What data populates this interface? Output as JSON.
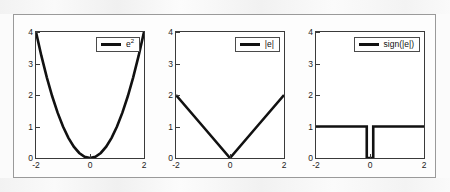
{
  "figure": {
    "background_color": "#fbfbfb",
    "frame_color": "#9a9a9a",
    "line_color": "#111111",
    "axis_color": "#3a3a3a"
  },
  "chart_data": [
    {
      "type": "line",
      "title": "",
      "xlabel": "",
      "ylabel": "",
      "xlim": [
        -2,
        2
      ],
      "ylim": [
        0,
        4
      ],
      "xticks": [
        -2,
        0,
        2
      ],
      "xticklabels": [
        "-2",
        "0",
        "2"
      ],
      "yticks": [
        0,
        1,
        2,
        3,
        4
      ],
      "yticklabels": [
        "0",
        "1",
        "2",
        "3",
        "4"
      ],
      "grid": false,
      "legend_position": "upper right",
      "series": [
        {
          "name": "e^2",
          "legend_label_base": "e",
          "legend_label_sup": "2",
          "color": "#111111",
          "linewidth": 2.6,
          "x": [
            -2,
            -1.8,
            -1.6,
            -1.4,
            -1.2,
            -1,
            -0.8,
            -0.6,
            -0.4,
            -0.2,
            0,
            0.2,
            0.4,
            0.6,
            0.8,
            1,
            1.2,
            1.4,
            1.6,
            1.8,
            2
          ],
          "y": [
            4,
            3.24,
            2.56,
            1.96,
            1.44,
            1,
            0.64,
            0.36,
            0.16,
            0.04,
            0,
            0.04,
            0.16,
            0.36,
            0.64,
            1,
            1.44,
            1.96,
            2.56,
            3.24,
            4
          ]
        }
      ]
    },
    {
      "type": "line",
      "title": "",
      "xlabel": "",
      "ylabel": "",
      "xlim": [
        -2,
        2
      ],
      "ylim": [
        0,
        4
      ],
      "xticks": [
        -2,
        0,
        2
      ],
      "xticklabels": [
        "-2",
        "0",
        "2"
      ],
      "yticks": [
        0,
        1,
        2,
        3,
        4
      ],
      "yticklabels": [
        "0",
        "1",
        "2",
        "3",
        "4"
      ],
      "grid": false,
      "legend_position": "upper right",
      "series": [
        {
          "name": "|e|",
          "legend_label_base": "|e|",
          "legend_label_sup": "",
          "color": "#111111",
          "linewidth": 2.6,
          "x": [
            -2,
            -1,
            0,
            1,
            2
          ],
          "y": [
            2,
            1,
            0,
            1,
            2
          ]
        }
      ]
    },
    {
      "type": "line",
      "title": "",
      "xlabel": "",
      "ylabel": "",
      "xlim": [
        -2,
        2
      ],
      "ylim": [
        0,
        4
      ],
      "xticks": [
        -2,
        0,
        2
      ],
      "xticklabels": [
        "-2",
        "0",
        "2"
      ],
      "yticks": [
        0,
        1,
        2,
        3,
        4
      ],
      "yticklabels": [
        "0",
        "1",
        "2",
        "3",
        "4"
      ],
      "grid": false,
      "legend_position": "upper right",
      "series": [
        {
          "name": "sign(|e|)",
          "legend_label_base": "sign(|e|)",
          "legend_label_sup": "",
          "color": "#111111",
          "linewidth": 2.6,
          "x": [
            -2,
            -0.12,
            -0.12,
            0.12,
            0.12,
            2
          ],
          "y": [
            1,
            1,
            0,
            0,
            1,
            1
          ]
        }
      ]
    }
  ]
}
